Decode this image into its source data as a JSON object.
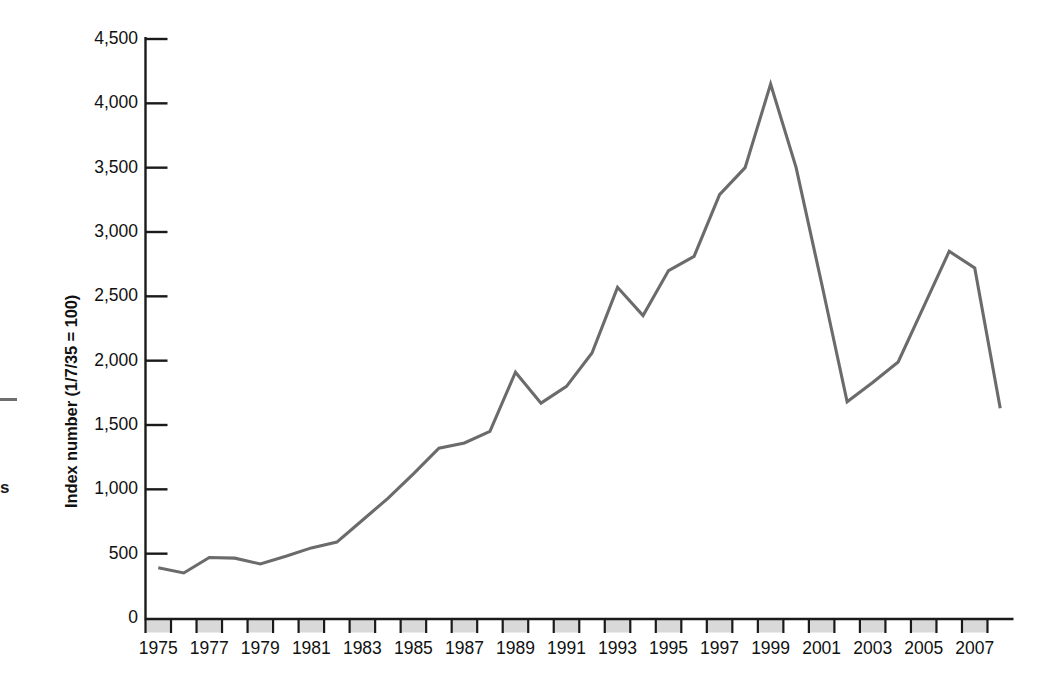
{
  "figure": {
    "line_color": "#6b6b6b",
    "axis_color": "#1a1a1a",
    "band_color": "#d9d9d9",
    "text_color": "#111111"
  },
  "edge_artifacts": {
    "dash": "",
    "char": "s"
  },
  "chart_data": {
    "type": "line",
    "title": "",
    "xlabel": "",
    "ylabel": "Index number (1/7/35 = 100)",
    "ylim": [
      0,
      4500
    ],
    "xlim": [
      1975,
      2008
    ],
    "grid": false,
    "legend": null,
    "ytick_labels": [
      "0",
      "500",
      "1,000",
      "1,500",
      "2,000",
      "2,500",
      "3,000",
      "3,500",
      "4,000",
      "4,500"
    ],
    "ytick_values": [
      0,
      500,
      1000,
      1500,
      2000,
      2500,
      3000,
      3500,
      4000,
      4500
    ],
    "xtick_labels": [
      "1975",
      "1977",
      "1979",
      "1981",
      "1983",
      "1985",
      "1987",
      "1989",
      "1991",
      "1993",
      "1995",
      "1997",
      "1999",
      "2001",
      "2003",
      "2005",
      "2007"
    ],
    "xtick_values": [
      1975,
      1977,
      1979,
      1981,
      1983,
      1985,
      1987,
      1989,
      1991,
      1993,
      1995,
      1997,
      1999,
      2001,
      2003,
      2005,
      2007
    ],
    "x": [
      1975,
      1976,
      1977,
      1978,
      1979,
      1980,
      1981,
      1982,
      1983,
      1984,
      1985,
      1986,
      1987,
      1988,
      1989,
      1990,
      1991,
      1992,
      1993,
      1994,
      1995,
      1996,
      1997,
      1998,
      1999,
      2000,
      2001,
      2002,
      2003,
      2004,
      2005,
      2006,
      2007,
      2008
    ],
    "values": [
      390,
      350,
      470,
      465,
      420,
      480,
      545,
      590,
      760,
      930,
      1120,
      1320,
      1360,
      1450,
      1910,
      1670,
      1800,
      2060,
      2570,
      2350,
      2700,
      2810,
      3290,
      3500,
      4150,
      3500,
      2600,
      1680,
      1830,
      1990,
      2420,
      2850,
      2720,
      1630
    ]
  }
}
